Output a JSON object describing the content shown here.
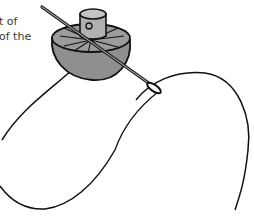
{
  "caption": {
    "lines": [
      "t of",
      "of the"
    ]
  },
  "illustration": {
    "subject": "pincushion-with-needle-and-thread",
    "colors": {
      "outline": "#111111",
      "body_fill": "#8f8f8f",
      "top_fill": "#a9a9a9",
      "thread": "#111111",
      "background": "#ffffff",
      "text": "#3a3a3a"
    }
  }
}
